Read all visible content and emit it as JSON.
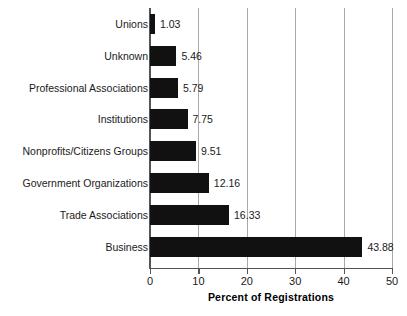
{
  "chart_data": {
    "type": "bar",
    "orientation": "horizontal",
    "title": "",
    "xlabel": "Percent of Registrations",
    "ylabel": "",
    "xlim": [
      0,
      50
    ],
    "xticks": [
      "0",
      "10",
      "20",
      "30",
      "40",
      "50"
    ],
    "grid": "vertical",
    "legend": "none",
    "categories": [
      "Unions",
      "Unknown",
      "Professional Associations",
      "Institutions",
      "Nonprofits/Citizens Groups",
      "Government Organizations",
      "Trade Associations",
      "Business"
    ],
    "values": [
      1.03,
      5.46,
      5.79,
      7.75,
      9.51,
      12.16,
      16.33,
      43.88
    ],
    "value_labels": [
      "1.03",
      "5.46",
      "5.79",
      "7.75",
      "9.51",
      "12.16",
      "16.33",
      "43.88"
    ],
    "colors": {
      "bar": "#111111",
      "grid": "#a8a8a8",
      "axis": "#555555",
      "text": "#1a1a1a",
      "background": "#ffffff"
    }
  }
}
